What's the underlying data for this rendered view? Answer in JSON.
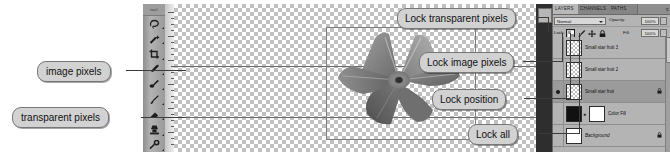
{
  "callouts": {
    "lock_transparent": "Lock transparent pixels",
    "lock_image": "Lock image pixels",
    "lock_position": "Lock position",
    "lock_all": "Lock all",
    "image_pixels": "image pixels",
    "transparent_pixels": "transparent pixels"
  },
  "toolbar": {
    "header": "tool",
    "tools": [
      {
        "name": "lasso-tool"
      },
      {
        "name": "magic-wand-tool"
      },
      {
        "name": "crop-tool"
      },
      {
        "name": "eyedropper-tool"
      },
      {
        "name": "healing-brush-tool"
      },
      {
        "name": "brush-tool"
      },
      {
        "name": "clone-stamp-tool"
      },
      {
        "name": "eraser-tool"
      },
      {
        "name": "gradient-tool"
      },
      {
        "name": "blur-tool"
      },
      {
        "name": "dodge-tool"
      },
      {
        "name": "paint-bucket-tool"
      }
    ]
  },
  "panel": {
    "tabs": [
      {
        "label": "LAYERS",
        "active": true
      },
      {
        "label": "CHANNELS",
        "active": false
      },
      {
        "label": "PATHS",
        "active": false
      }
    ],
    "menu_glyph": "≡",
    "blend_mode": "Normal",
    "opacity_label": "Opacity:",
    "opacity_value": "100%",
    "lock_label": "Lock:",
    "fill_label": "Fill:",
    "fill_value": "100%",
    "lock_buttons": [
      {
        "name": "lock-transparent-pixels-button",
        "selected": true
      },
      {
        "name": "lock-image-pixels-button",
        "selected": false
      },
      {
        "name": "lock-position-button",
        "selected": false
      },
      {
        "name": "lock-all-button",
        "selected": false
      }
    ],
    "layers": [
      {
        "name": "Small star fruit 3",
        "visible": false,
        "selected": false,
        "thumb": "checker",
        "italic": false,
        "locked": false,
        "mask": false
      },
      {
        "name": "Small star fruit 2",
        "visible": false,
        "selected": false,
        "thumb": "checker",
        "italic": false,
        "locked": false,
        "mask": false
      },
      {
        "name": "Small star fruit",
        "visible": true,
        "selected": true,
        "thumb": "checker",
        "italic": false,
        "locked": true,
        "mask": false
      },
      {
        "name": "Color Fill",
        "visible": false,
        "selected": false,
        "thumb": "black",
        "italic": false,
        "locked": false,
        "mask": true
      },
      {
        "name": "Background",
        "visible": false,
        "selected": false,
        "thumb": "white",
        "italic": true,
        "locked": true,
        "mask": false
      }
    ]
  },
  "canvas": {
    "artwork_name": "star-fruit-carambola-grayscale",
    "selection_label": "layer-bounding-box"
  },
  "colors": {
    "panel_bg": "#b4b4b4",
    "panel_selected_row": "#9b9b9b",
    "callout_bg": "#d2d2d2",
    "dock_strip": "#2e2e2e",
    "checker": "#c0c0c0"
  }
}
